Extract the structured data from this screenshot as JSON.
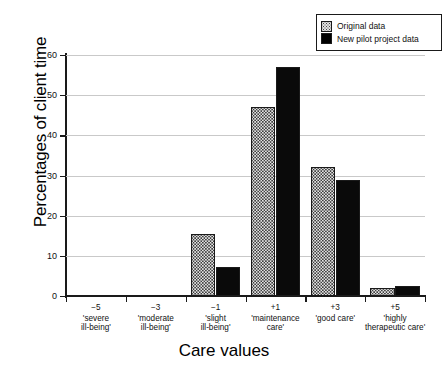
{
  "chart_data": {
    "type": "bar",
    "title": "",
    "xlabel": "Care values",
    "ylabel": "Percentages of client time",
    "ylim": [
      0,
      60
    ],
    "yticks": [
      0,
      10,
      20,
      30,
      40,
      50,
      60
    ],
    "grid": true,
    "legend_position": "top-right",
    "categories": [
      {
        "num": "−5",
        "desc": "'severe\nill-being'"
      },
      {
        "num": "−3",
        "desc": "'moderate\nill-being'"
      },
      {
        "num": "−1",
        "desc": "'slight\nill-being'"
      },
      {
        "num": "+1",
        "desc": "'maintenance\ncare'"
      },
      {
        "num": "+3",
        "desc": "'good care'"
      },
      {
        "num": "+5",
        "desc": "'highly\ntherapeutic care'"
      }
    ],
    "category_labels": [
      "−5",
      "−3",
      "−1",
      "+1",
      "+3",
      "+5"
    ],
    "series": [
      {
        "name": "Original data",
        "values": [
          0,
          0,
          15.5,
          47,
          32,
          2
        ],
        "fill": "stipple"
      },
      {
        "name": "New pilot project data",
        "values": [
          0,
          0,
          7.3,
          57,
          28.8,
          2.5
        ],
        "fill": "solid"
      }
    ]
  },
  "legend": {
    "items": [
      {
        "label": "Original data",
        "swatch": "stipple-swatch"
      },
      {
        "label": "New pilot project data",
        "swatch": "solid-black-swatch"
      }
    ]
  },
  "colors": {
    "axis": "#1a1a1a",
    "grid": "#c9c9c9",
    "series_solid": "#0a0a0a",
    "series_stipple_bg": "#e6e6e6",
    "background": "#ffffff"
  }
}
